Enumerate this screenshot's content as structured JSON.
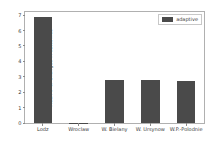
{
  "chart_data": {
    "type": "bar",
    "title": "",
    "xlabel": "",
    "ylabel": "Mean # of Changes in outcomes",
    "categories": [
      "Lodz",
      "Wroclaw",
      "W. Bielany",
      "W. Ursynow",
      "W.P.-Polodnie"
    ],
    "series": [
      {
        "name": "adaptive",
        "values": [
          6.85,
          0.03,
          2.8,
          2.82,
          2.75
        ],
        "color": "#4a4a4a"
      }
    ],
    "ylim": [
      0,
      7.2
    ],
    "yticks": [
      0,
      1,
      2,
      3,
      4,
      5,
      6,
      7
    ],
    "ytick_labels": [
      "0",
      "1",
      "2",
      "3",
      "4",
      "5",
      "6",
      "7"
    ],
    "grid": false,
    "legend": {
      "position": "upper right",
      "entries": [
        {
          "label": "adaptive",
          "color": "#4a4a4a"
        }
      ]
    }
  },
  "figure": {
    "background_color": "#ffffff",
    "axes_color": "#b0b0b0",
    "text_color": "#3a3a3a"
  }
}
